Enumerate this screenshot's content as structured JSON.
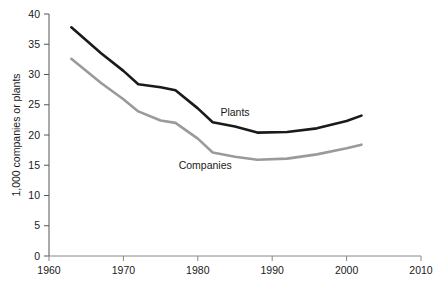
{
  "chart_data": {
    "type": "line",
    "title": "",
    "subtitle": "",
    "xlabel": "",
    "ylabel": "1,000 companies or plants",
    "xlim": [
      1960,
      2010
    ],
    "ylim": [
      0,
      40
    ],
    "xticks": [
      1960,
      1970,
      1980,
      1990,
      2000,
      2010
    ],
    "yticks": [
      0,
      5,
      10,
      15,
      20,
      25,
      30,
      35,
      40
    ],
    "grid": false,
    "legend_position": "inline-annotation",
    "series": [
      {
        "name": "Plants",
        "color": "#1a1a1a",
        "x": [
          1963,
          1967,
          1970,
          1972,
          1975,
          1977,
          1980,
          1982,
          1985,
          1988,
          1992,
          1996,
          2000,
          2002
        ],
        "values": [
          37.8,
          33.5,
          30.6,
          28.4,
          27.9,
          27.4,
          24.4,
          22.1,
          21.4,
          20.4,
          20.5,
          21.1,
          22.3,
          23.2
        ]
      },
      {
        "name": "Companies",
        "color": "#9a9a9a",
        "x": [
          1963,
          1967,
          1970,
          1972,
          1975,
          1977,
          1980,
          1982,
          1985,
          1988,
          1992,
          1996,
          2000,
          2002
        ],
        "values": [
          32.6,
          28.6,
          25.9,
          23.9,
          22.4,
          22.0,
          19.4,
          17.1,
          16.4,
          15.9,
          16.1,
          16.8,
          17.8,
          18.4
        ]
      }
    ],
    "annotations": [
      {
        "text": "Plants",
        "x": 1985,
        "y": 23.1,
        "color": "#1a1a1a"
      },
      {
        "text": "Companies",
        "x": 1981,
        "y": 14.4,
        "color": "#1a1a1a"
      }
    ]
  },
  "axis": {
    "y_title": "1,000 companies or plants",
    "y_tick_labels": [
      "40",
      "35",
      "30",
      "25",
      "20",
      "15",
      "10",
      "5",
      "0"
    ],
    "x_tick_labels": [
      "1960",
      "1970",
      "1980",
      "1990",
      "2000",
      "2010"
    ]
  }
}
